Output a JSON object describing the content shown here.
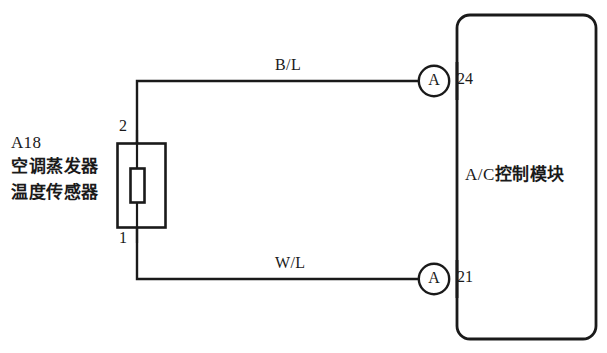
{
  "diagram": {
    "type": "automotive-wiring-diagram",
    "canvas": {
      "width": 607,
      "height": 353
    },
    "colors": {
      "background": "#ffffff",
      "line": "#1a1a1a",
      "text": "#1a1a1a"
    }
  },
  "sensor": {
    "id_code": "A18",
    "name_line1": "空调蒸发器",
    "name_line2": "温度传感器",
    "symbol": "thermistor",
    "pins": [
      {
        "number": "2",
        "position": "top"
      },
      {
        "number": "1",
        "position": "bottom"
      }
    ]
  },
  "wires": [
    {
      "label": "B/L",
      "from_pin": "2",
      "to_pin": "24",
      "position": "upper"
    },
    {
      "label": "W/L",
      "from_pin": "1",
      "to_pin": "21",
      "position": "lower"
    }
  ],
  "connectors": [
    {
      "letter": "A",
      "position": "upper"
    },
    {
      "letter": "A",
      "position": "lower"
    }
  ],
  "module": {
    "name": "A/C控制模块",
    "name_prefix": "A/C",
    "name_suffix": "控制模块",
    "pins": [
      {
        "number": "24",
        "position": "upper"
      },
      {
        "number": "21",
        "position": "lower"
      }
    ]
  }
}
